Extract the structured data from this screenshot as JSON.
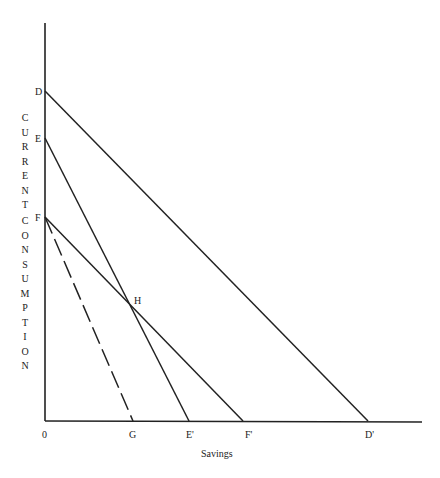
{
  "diagram": {
    "type": "budget-line diagram",
    "x_axis_label": "Savings",
    "y_axis_label_part1": [
      "C",
      "U",
      "R",
      "R",
      "E",
      "N",
      "T"
    ],
    "y_axis_label_part2": [
      "C",
      "O",
      "N",
      "S",
      "U",
      "M",
      "P",
      "T",
      "I",
      "O",
      "N"
    ],
    "points": {
      "origin": "0",
      "D": "D",
      "E": "E",
      "F": "F",
      "H": "H",
      "G": "G",
      "E_prime": "E'",
      "F_prime": "F'",
      "D_prime": "D'"
    },
    "lines": [
      {
        "from": "D",
        "to": "D'",
        "style": "solid"
      },
      {
        "from": "E",
        "to": "E'",
        "style": "solid"
      },
      {
        "from": "F",
        "to": "F'",
        "style": "solid"
      },
      {
        "from": "F",
        "to": "G",
        "style": "dashed"
      }
    ],
    "intersection": "H"
  }
}
